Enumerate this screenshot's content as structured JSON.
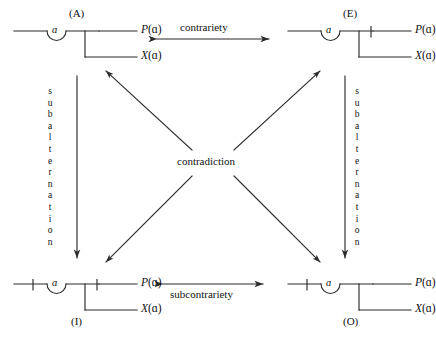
{
  "diagram": {
    "center_label": "contradiction",
    "top_relation": "contrariety",
    "bottom_relation": "subcontrariety",
    "side_relation": "subalternation",
    "side_relation_letters": [
      "s",
      "u",
      "b",
      "a",
      "l",
      "t",
      "e",
      "r",
      "n",
      "a",
      "t",
      "i",
      "o",
      "n"
    ],
    "alpha_symbol": "ɑ",
    "predicate_upper": "P(ɑ)",
    "predicate_lower": "X(ɑ)",
    "predicate_upper_fn": "P",
    "predicate_lower_fn": "X",
    "predicate_arg": "(ɑ)",
    "line_color": "#2b2b2b",
    "text_color": "#111111",
    "background": "#ffffff",
    "corners": [
      {
        "id": "A",
        "mood": "(A)",
        "position": "top-left",
        "mood_position": "above",
        "negation_ticks": [],
        "upper": "P(ɑ)",
        "lower": "X(ɑ)"
      },
      {
        "id": "E",
        "mood": "(E)",
        "position": "top-right",
        "mood_position": "above",
        "negation_ticks": [
          "upper-branch"
        ],
        "upper": "P(ɑ)",
        "lower": "X(ɑ)"
      },
      {
        "id": "I",
        "mood": "(I)",
        "position": "bottom-left",
        "mood_position": "below",
        "negation_ticks": [
          "left-stem",
          "upper-branch"
        ],
        "upper": "P(ɑ)",
        "lower": "X(ɑ)"
      },
      {
        "id": "O",
        "mood": "(O)",
        "position": "bottom-right",
        "mood_position": "below",
        "negation_ticks": [
          "left-stem"
        ],
        "upper": "P(ɑ)",
        "lower": "X(ɑ)"
      }
    ],
    "arrows": {
      "top": {
        "label": "contrariety",
        "style": "double-headed-horizontal"
      },
      "bottom": {
        "label": "subcontrariety",
        "style": "double-headed-horizontal"
      },
      "left": {
        "label": "subalternation",
        "style": "single-headed-down"
      },
      "right": {
        "label": "subalternation",
        "style": "single-headed-down"
      },
      "diagonals": {
        "label": "contradiction",
        "style": "four-arrows-outward-from-center",
        "count": 4
      }
    }
  }
}
